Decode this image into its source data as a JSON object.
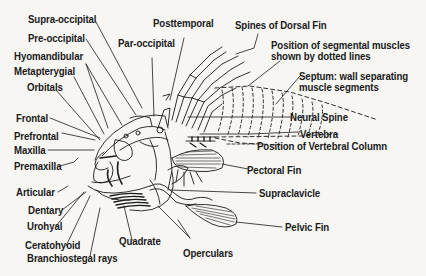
{
  "diagram": {
    "colors": {
      "background": "#f7f6f3",
      "ink": "#1a1a1a"
    },
    "labels": {
      "supra_occipital": "Supra-occipital",
      "pre_occipital": "Pre-occipital",
      "hyomandibular": "Hyomandibular",
      "metapterygial": "Metapterygial",
      "orbitals": "Orbitals",
      "frontal": "Frontal",
      "prefrontal": "Prefrontal",
      "maxilla": "Maxilla",
      "premaxilla": "Premaxilla",
      "articular": "Articular",
      "dentary": "Dentary",
      "urohyal": "Urohyal",
      "ceratohyoid": "Ceratohyoid",
      "branchiostegal_rays": "Branchiostegal rays",
      "quadrate": "Quadrate",
      "operculars": "Operculars",
      "posttemporal": "Posttemporal",
      "par_occipital": "Par-occipital",
      "spines_of_dorsal_fin": "Spines of Dorsal Fin",
      "segmental_muscles": "Position of segmental muscles\nshown by dotted lines",
      "septum": "Septum: wall separating\nmuscle segments",
      "neural_spine": "Neural Spine",
      "vertebra": "Vertebra",
      "vertebral_column": "Position of Vertebral Column",
      "pectoral_fin": "Pectoral Fin",
      "supraclavicle": "Supraclavicle",
      "pelvic_fin": "Pelvic Fin"
    }
  }
}
